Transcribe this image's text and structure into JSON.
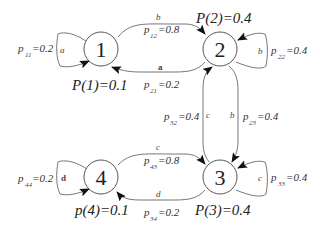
{
  "diagram": {
    "type": "markov-chain",
    "nodes": [
      {
        "id": "1",
        "label": "1",
        "prob_label": "P(1)=0.1"
      },
      {
        "id": "2",
        "label": "2",
        "prob_label": "P(2)=0.4"
      },
      {
        "id": "3",
        "label": "3",
        "prob_label": "P(3)=0.4"
      },
      {
        "id": "4",
        "label": "4",
        "prob_label": "p(4)=0.1"
      }
    ],
    "edges": [
      {
        "from": "1",
        "to": "1",
        "symbol": "a",
        "p": "p",
        "sub": "11",
        "value": "=0.2"
      },
      {
        "from": "1",
        "to": "2",
        "symbol": "b",
        "p": "p",
        "sub": "12",
        "value": "=0.8"
      },
      {
        "from": "2",
        "to": "1",
        "symbol": "a",
        "p": "p",
        "sub": "21",
        "value": "=0.2"
      },
      {
        "from": "2",
        "to": "2",
        "symbol": "b",
        "p": "p",
        "sub": "22",
        "value": "=0.4"
      },
      {
        "from": "2",
        "to": "3",
        "symbol": "b",
        "p": "p",
        "sub": "23",
        "value": "=0.4"
      },
      {
        "from": "3",
        "to": "2",
        "symbol": "c",
        "p": "p",
        "sub": "32",
        "value": "=0.4"
      },
      {
        "from": "3",
        "to": "3",
        "symbol": "c",
        "p": "p",
        "sub": "33",
        "value": "=0.4"
      },
      {
        "from": "4",
        "to": "3",
        "symbol": "c",
        "p": "p",
        "sub": "43",
        "value": "=0.8"
      },
      {
        "from": "3",
        "to": "4",
        "symbol": "d",
        "p": "p",
        "sub": "34",
        "value": "=0.2"
      },
      {
        "from": "4",
        "to": "4",
        "symbol": "d",
        "p": "p",
        "sub": "44",
        "value": "=0.2"
      }
    ]
  }
}
